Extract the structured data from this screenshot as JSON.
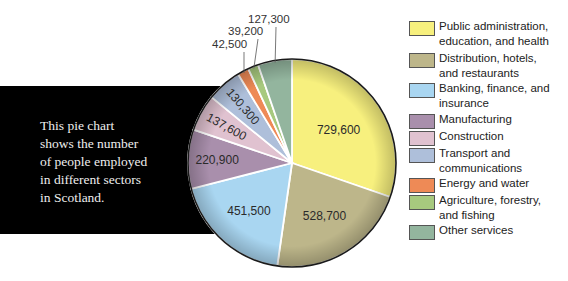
{
  "description": {
    "lines": [
      "This pie chart",
      "shows the number",
      "of people employed",
      "in different sectors",
      "in Scotland."
    ]
  },
  "chart_data": {
    "type": "pie",
    "title": "",
    "categories": [
      "Public administration, education, and health",
      "Distribution, hotels, and restaurants",
      "Banking, finance, and insurance",
      "Manufacturing",
      "Construction",
      "Transport and communications",
      "Energy and water",
      "Agriculture, forestry, and fishing",
      "Other services"
    ],
    "values": [
      729600,
      528700,
      451500,
      220900,
      137600,
      130300,
      42500,
      39200,
      127300
    ],
    "value_labels": [
      "729,600",
      "528,700",
      "451,500",
      "220,900",
      "137,600",
      "130,300",
      "42,500",
      "39,200",
      "127,300"
    ],
    "colors": [
      "#f7f07e",
      "#bdb68a",
      "#a9d6f1",
      "#a98fac",
      "#e0c2d0",
      "#aebfda",
      "#ee8a56",
      "#a7c97e",
      "#93b59e"
    ],
    "start_angle_deg": 0,
    "direction": "clockwise",
    "legend_position": "right",
    "description": "This pie chart shows the number of people employed in different sectors in Scotland."
  },
  "legend": {
    "items": [
      {
        "lines": [
          "Public administration,",
          "education, and health"
        ]
      },
      {
        "lines": [
          "Distribution, hotels,",
          "and restaurants"
        ]
      },
      {
        "lines": [
          "Banking, finance, and",
          "insurance"
        ]
      },
      {
        "lines": [
          "Manufacturing"
        ]
      },
      {
        "lines": [
          "Construction"
        ]
      },
      {
        "lines": [
          "Transport and",
          "communications"
        ]
      },
      {
        "lines": [
          "Energy and water"
        ]
      },
      {
        "lines": [
          "Agriculture, forestry,",
          "and fishing"
        ]
      },
      {
        "lines": [
          "Other services"
        ]
      }
    ]
  }
}
